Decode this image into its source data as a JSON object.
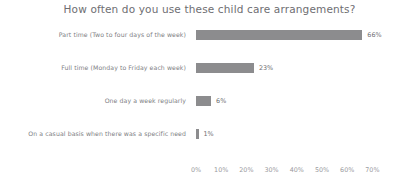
{
  "chart_data": {
    "type": "bar",
    "orientation": "horizontal",
    "title": "How often do you use these child care arrangements?",
    "xlabel": "",
    "ylabel": "",
    "categories": [
      "Part time (Two to four days of the week)",
      "Full time (Monday to Friday each week)",
      "One day a week regularly",
      "On a casual basis when there was a specific need"
    ],
    "values": [
      66,
      23,
      6,
      1
    ],
    "value_labels": [
      "66%",
      "23%",
      "6%",
      "1%"
    ],
    "xlim": [
      0,
      70
    ],
    "xticks": [
      0,
      10,
      20,
      30,
      40,
      50,
      60,
      70
    ],
    "xtick_labels": [
      "0%",
      "10%",
      "20%",
      "30%",
      "40%",
      "50%",
      "60%",
      "70%"
    ],
    "grid": false,
    "legend": false,
    "bar_color": "#8c8c8e",
    "text_color": "#808084",
    "title_color": "#6e6e72",
    "background_color": "#ffffff"
  }
}
